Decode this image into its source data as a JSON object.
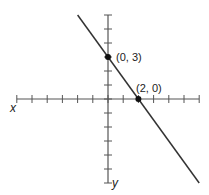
{
  "chart_data": {
    "type": "line",
    "title": "",
    "xlabel": "x",
    "ylabel": "y",
    "xlim": [
      -6,
      6
    ],
    "ylim": [
      -6,
      6
    ],
    "grid": false,
    "x_ticks": [
      -6,
      -5,
      -4,
      -3,
      -2,
      -1,
      0,
      1,
      2,
      3,
      4,
      5,
      6
    ],
    "y_ticks": [
      -6,
      -5,
      -4,
      -3,
      -2,
      -1,
      0,
      1,
      2,
      3,
      4,
      5,
      6
    ],
    "series": [
      {
        "name": "line",
        "equation": "y = -3/2 x + 3",
        "x": [
          -2,
          6
        ],
        "y": [
          6,
          -6
        ]
      }
    ],
    "points": [
      {
        "x": 0,
        "y": 3,
        "label": "(0, 3)"
      },
      {
        "x": 2,
        "y": 0,
        "label": "(2, 0)"
      }
    ]
  },
  "labels": {
    "x_axis": "x",
    "y_axis": "y",
    "point_a": "(0, 3)",
    "point_b": "(2, 0)"
  },
  "colors": {
    "axis": "#555555",
    "line": "#333333",
    "point": "#111111"
  }
}
